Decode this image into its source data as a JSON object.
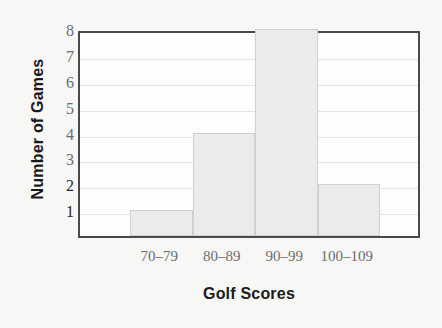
{
  "chart_data": {
    "type": "bar",
    "title": "",
    "subtitle": "",
    "xlabel": "Golf Scores",
    "ylabel": "Number of Games",
    "categories": [
      "70–79",
      "80–89",
      "90–99",
      "100–109"
    ],
    "values": [
      1,
      4,
      8,
      2
    ],
    "series": [
      {
        "name": "Number of Games",
        "values": [
          1,
          4,
          8,
          2
        ]
      }
    ],
    "ylim": [
      0,
      8
    ],
    "xlim": [
      0,
      342
    ],
    "y_ticks": [
      1,
      2,
      3,
      4,
      5,
      6,
      7,
      8
    ],
    "y_tick_labels": [
      "1",
      "2",
      "3",
      "4",
      "5",
      "6",
      "7",
      "8"
    ],
    "grid": true,
    "grid_axis": "y",
    "legend": false,
    "legend_position": "none",
    "annotations": []
  },
  "axes": {
    "y": {
      "title": "Number of Games",
      "ticks": [
        {
          "label": "8",
          "value": 8,
          "emphasis": false,
          "mark": false
        },
        {
          "label": "7",
          "value": 7,
          "emphasis": false,
          "mark": false
        },
        {
          "label": "6",
          "value": 6,
          "emphasis": false,
          "mark": false
        },
        {
          "label": "5",
          "value": 5,
          "emphasis": false,
          "mark": false
        },
        {
          "label": "4",
          "value": 4,
          "emphasis": false,
          "mark": false
        },
        {
          "label": "3",
          "value": 3,
          "emphasis": false,
          "mark": false
        },
        {
          "label": "2",
          "value": 2,
          "emphasis": true,
          "mark": true
        },
        {
          "label": "1",
          "value": 1,
          "emphasis": true,
          "mark": true
        }
      ]
    },
    "x": {
      "title": "Golf Scores",
      "ticks": [
        {
          "label": "70–79",
          "value": 1
        },
        {
          "label": "80–89",
          "value": 4
        },
        {
          "label": "90–99",
          "value": 8
        },
        {
          "label": "100–109",
          "value": 2
        }
      ]
    }
  },
  "colors": {
    "page_background": "#f7f7f6",
    "plot_background": "#fdfdfd",
    "bar_fill": "#ebebeb",
    "bar_stroke": "#cfcfcf",
    "frame": "#4a4a4a",
    "gridline": "#e4e4e4",
    "tick_label": "#6d6d6d",
    "tick_label_emphasis": "#262626",
    "axis_title": "#1a1a1a"
  }
}
